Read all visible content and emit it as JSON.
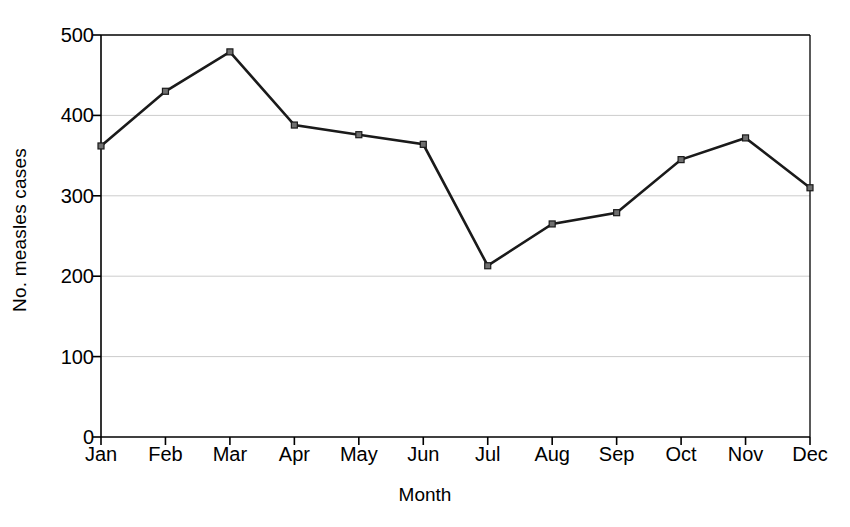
{
  "chart_data": {
    "type": "line",
    "title": "",
    "subtitle": "",
    "xlabel": "Month",
    "ylabel": "No. measles cases",
    "categories": [
      "Jan",
      "Feb",
      "Mar",
      "Apr",
      "May",
      "Jun",
      "Jul",
      "Aug",
      "Sep",
      "Oct",
      "Nov",
      "Dec"
    ],
    "values": [
      362,
      430,
      479,
      388,
      376,
      364,
      213,
      265,
      279,
      345,
      372,
      310
    ],
    "series": [
      {
        "name": "No. measles cases",
        "values": [
          362,
          430,
          479,
          388,
          376,
          364,
          213,
          265,
          279,
          345,
          372,
          310
        ]
      }
    ],
    "ylim": [
      0,
      500
    ],
    "yticks": [
      0,
      100,
      200,
      300,
      400,
      500
    ],
    "ytick_labels": [
      "0",
      "100",
      "200",
      "300",
      "400",
      "500"
    ],
    "xtick_labels": [
      "Jan",
      "Feb",
      "Mar",
      "Apr",
      "May",
      "Jun",
      "Jul",
      "Aug",
      "Sep",
      "Oct",
      "Nov",
      "Dec"
    ],
    "grid": true,
    "grid_axis": "y",
    "legend": false,
    "legend_position": "none",
    "marker": "square",
    "line_color": "#1a1a1a",
    "marker_color": "#1a1a1a",
    "grid_color": "#cccccc",
    "axis_color": "#000000",
    "background_color": "#ffffff"
  }
}
